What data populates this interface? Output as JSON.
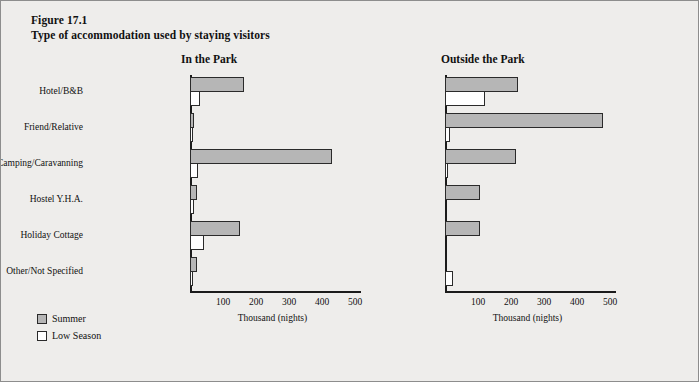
{
  "figure": {
    "number": "Figure 17.1",
    "title": "Type of accommodation used by staying visitors"
  },
  "legend": {
    "items": [
      {
        "label": "Summer",
        "color": "#b6b6b6",
        "key": "summer"
      },
      {
        "label": "Low Season",
        "color": "#ffffff",
        "key": "low"
      }
    ]
  },
  "axis": {
    "caption": "Thousand (nights)",
    "ticks": [
      "100",
      "200",
      "300",
      "400",
      "500"
    ]
  },
  "panels": [
    {
      "title": "In the Park"
    },
    {
      "title": "Outside the Park"
    }
  ],
  "categories": [
    "Hotel/B&B",
    "Friend/Relative",
    "Camping/Caravanning",
    "Hostel Y.H.A.",
    "Holiday Cottage",
    "Other/Not Specified"
  ],
  "chart_data": [
    {
      "type": "bar",
      "title": "In the Park",
      "orientation": "horizontal",
      "xlabel": "Thousand (nights)",
      "ylabel": "",
      "xlim": [
        0,
        500
      ],
      "xticks": [
        100,
        200,
        300,
        400,
        500
      ],
      "grid": false,
      "legend_position": "below-left",
      "categories": [
        "Hotel/B&B",
        "Friend/Relative",
        "Camping/Caravanning",
        "Hostel Y.H.A.",
        "Holiday Cottage",
        "Other/Not Specified"
      ],
      "series": [
        {
          "name": "Summer",
          "values": [
            165,
            12,
            430,
            22,
            150,
            20
          ]
        },
        {
          "name": "Low Season",
          "values": [
            30,
            8,
            25,
            12,
            42,
            8
          ]
        }
      ]
    },
    {
      "type": "bar",
      "title": "Outside the Park",
      "orientation": "horizontal",
      "xlabel": "Thousand (nights)",
      "ylabel": "",
      "xlim": [
        0,
        500
      ],
      "xticks": [
        100,
        200,
        300,
        400,
        500
      ],
      "grid": false,
      "legend_position": "below-left",
      "categories": [
        "Hotel/B&B",
        "Friend/Relative",
        "Camping/Caravanning",
        "Hostel Y.H.A.",
        "Holiday Cottage",
        "Other/Not Specified"
      ],
      "series": [
        {
          "name": "Summer",
          "values": [
            220,
            480,
            215,
            105,
            105,
            0
          ]
        },
        {
          "name": "Low Season",
          "values": [
            120,
            15,
            10,
            0,
            0,
            25
          ]
        }
      ]
    }
  ]
}
